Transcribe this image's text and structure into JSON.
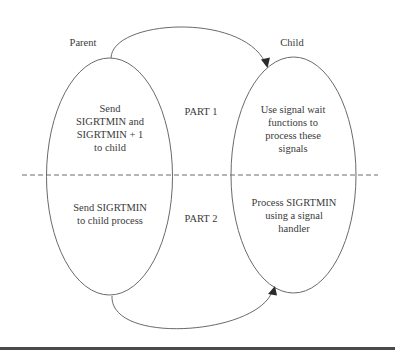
{
  "diagram": {
    "actors": {
      "parent": "Parent",
      "child": "Child"
    },
    "parts": [
      {
        "label": "PART 1",
        "parent_action": [
          "Send",
          "SIGRTMIN and",
          "SIGRTMIN + 1",
          "to child"
        ],
        "child_action": [
          "Use signal wait",
          "functions to",
          "process these",
          "signals"
        ]
      },
      {
        "label": "PART 2",
        "parent_action": [
          "Send SIGRTMIN",
          "to child process"
        ],
        "child_action": [
          "Process SIGRTMIN",
          "using a signal",
          "handler"
        ]
      }
    ],
    "arrows": [
      {
        "from": "parent",
        "to": "child",
        "part": "PART 1",
        "position": "top"
      },
      {
        "from": "parent",
        "to": "child",
        "part": "PART 2",
        "position": "bottom"
      }
    ],
    "colors": {
      "stroke": "#6a6a6a",
      "text": "#3a3a3a",
      "arrowhead": "#2a2a2a",
      "rule": "#4a4a4a"
    }
  }
}
